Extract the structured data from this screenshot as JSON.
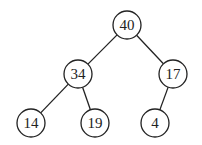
{
  "tree": {
    "type": "binary-tree",
    "nodes": [
      {
        "id": "n40",
        "label": "40",
        "x": 127,
        "y": 25
      },
      {
        "id": "n34",
        "label": "34",
        "x": 78,
        "y": 74
      },
      {
        "id": "n17",
        "label": "17",
        "x": 173,
        "y": 74
      },
      {
        "id": "n14",
        "label": "14",
        "x": 31,
        "y": 123
      },
      {
        "id": "n19",
        "label": "19",
        "x": 95,
        "y": 123
      },
      {
        "id": "n4",
        "label": "4",
        "x": 155,
        "y": 123
      }
    ],
    "edges": [
      {
        "from": "n40",
        "to": "n34"
      },
      {
        "from": "n40",
        "to": "n17"
      },
      {
        "from": "n34",
        "to": "n14"
      },
      {
        "from": "n34",
        "to": "n19"
      },
      {
        "from": "n17",
        "to": "n4"
      }
    ],
    "radius": 14
  }
}
